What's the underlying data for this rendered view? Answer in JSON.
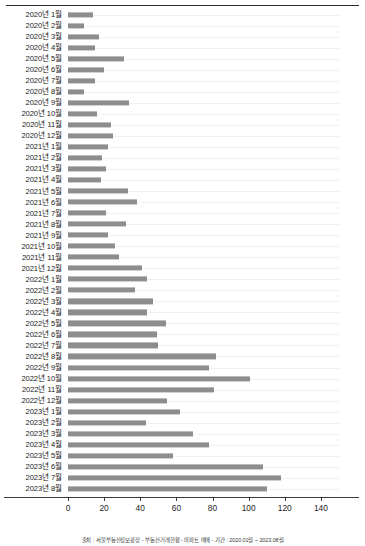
{
  "chart_data": {
    "type": "bar",
    "orientation": "horizontal",
    "title": "",
    "xlabel": "",
    "ylabel": "",
    "xlim": [
      0,
      150
    ],
    "xticks": [
      0,
      20,
      40,
      60,
      80,
      100,
      120,
      140
    ],
    "grid": true,
    "legend": "none",
    "bar_color": "#8d8d8d",
    "categories": [
      "2020년 1월",
      "2020년 2월",
      "2020년 3월",
      "2020년 4월",
      "2020년 5월",
      "2020년 6월",
      "2020년 7월",
      "2020년 8월",
      "2020년 9월",
      "2020년 10월",
      "2020년 11월",
      "2020년 12월",
      "2021년 1월",
      "2021년 2월",
      "2021년 3월",
      "2021년 4월",
      "2021년 5월",
      "2021년 6월",
      "2021년 7월",
      "2021년 8월",
      "2021년 9월",
      "2021년 10월",
      "2021년 11월",
      "2021년 12월",
      "2022년 1월",
      "2022년 2월",
      "2022년 3월",
      "2022년 4월",
      "2022년 5월",
      "2022년 6월",
      "2022년 7월",
      "2022년 8월",
      "2022년 9월",
      "2022년 10월",
      "2022년 11월",
      "2022년 12월",
      "2023년 1월",
      "2023년 2월",
      "2023년 3월",
      "2023년 4월",
      "2023년 5월",
      "2023년 6월",
      "2023년 7월",
      "2023년 8월"
    ],
    "values": [
      14,
      9,
      17,
      15,
      31,
      20,
      15,
      9,
      34,
      16,
      24,
      25,
      22,
      19,
      21,
      18,
      33,
      38,
      21,
      32,
      22,
      26,
      28,
      41,
      44,
      37,
      47,
      44,
      54,
      49,
      50,
      82,
      78,
      101,
      81,
      55,
      62,
      43,
      69,
      78,
      58,
      108,
      118,
      110
    ]
  },
  "axis": {
    "tick_labels": [
      "0",
      "20",
      "40",
      "60",
      "80",
      "100",
      "120",
      "140"
    ]
  },
  "caption": {
    "text": "출처 : 서울부동산정보광장 - 부동산거래현황 - 아파트 매매 - 기간 : 2020.01월 ~ 2023.08월"
  }
}
